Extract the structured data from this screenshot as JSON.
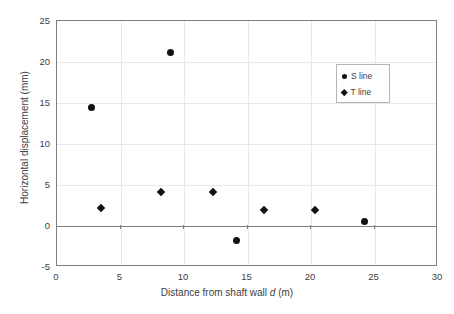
{
  "chart_data": {
    "type": "scatter",
    "title": "",
    "xlabel": "Distance from shaft wall d (m)",
    "xlabel_prefix": "Distance from shaft wall ",
    "xlabel_italic": "d",
    "xlabel_suffix": " (m)",
    "ylabel": "Horizontal displacement (mm)",
    "xlim": [
      0,
      30
    ],
    "ylim": [
      -5,
      25
    ],
    "xticks": [
      0,
      5,
      10,
      15,
      20,
      25,
      30
    ],
    "yticks": [
      -5,
      0,
      5,
      10,
      15,
      20,
      25
    ],
    "xtick_labels": [
      "0",
      "5",
      "10",
      "15",
      "20",
      "25",
      "30"
    ],
    "ytick_labels": [
      "-5",
      "0",
      "5",
      "10",
      "15",
      "20",
      "25"
    ],
    "grid": true,
    "grid_color": "#e8e8e8",
    "zero_line": true,
    "zero_line_color": "#7f7f7f",
    "marker_color": "#111111",
    "legend_position": "upper-right",
    "series": [
      {
        "name": "S line",
        "marker": "circle",
        "points": [
          {
            "x": 2.7,
            "y": 14.5
          },
          {
            "x": 8.9,
            "y": 21.2
          },
          {
            "x": 14.1,
            "y": -1.8
          },
          {
            "x": 24.2,
            "y": 0.5
          }
        ]
      },
      {
        "name": "T line",
        "marker": "diamond",
        "points": [
          {
            "x": 3.5,
            "y": 2.2
          },
          {
            "x": 8.2,
            "y": 4.2
          },
          {
            "x": 12.3,
            "y": 4.2
          },
          {
            "x": 16.3,
            "y": 1.9
          },
          {
            "x": 20.3,
            "y": 1.9
          }
        ]
      }
    ]
  },
  "legend": {
    "items": [
      {
        "label": "S line",
        "marker": "circle"
      },
      {
        "label": "T line",
        "marker": "diamond"
      }
    ]
  }
}
